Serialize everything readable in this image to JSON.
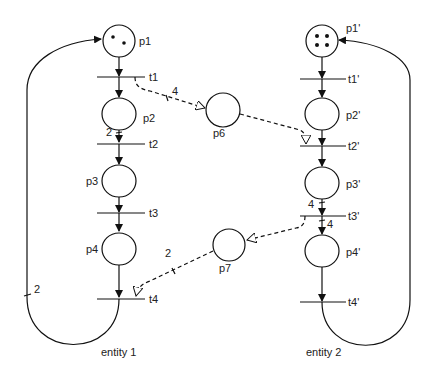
{
  "diagram": {
    "type": "petri-net",
    "entities": [
      {
        "label": "entity 1",
        "places": [
          {
            "id": "p1",
            "label": "p1",
            "tokens": 2
          },
          {
            "id": "p2",
            "label": "p2",
            "tokens": 0
          },
          {
            "id": "p3",
            "label": "p3",
            "tokens": 0
          },
          {
            "id": "p4",
            "label": "p4",
            "tokens": 0
          }
        ],
        "transitions": [
          "t1",
          "t2",
          "t3",
          "t4"
        ],
        "loop_weight": "2",
        "arc_weight_p2_t2": "2"
      },
      {
        "label": "entity 2",
        "places": [
          {
            "id": "p1'",
            "label": "p1'",
            "tokens": 4
          },
          {
            "id": "p2'",
            "label": "p2'",
            "tokens": 0
          },
          {
            "id": "p3'",
            "label": "p3'",
            "tokens": 0
          },
          {
            "id": "p4'",
            "label": "p4'",
            "tokens": 0
          }
        ],
        "transitions": [
          "t1'",
          "t2'",
          "t3'",
          "t4'"
        ],
        "arc_weight_p3_t3": "4",
        "arc_weight_t3_p4": "4"
      }
    ],
    "shared_places": [
      {
        "id": "p6",
        "label": "p6",
        "from": "t1",
        "to": "t2'",
        "weight": "4"
      },
      {
        "id": "p7",
        "label": "p7",
        "from": "t3'",
        "to": "t4",
        "weight": "2"
      }
    ]
  }
}
